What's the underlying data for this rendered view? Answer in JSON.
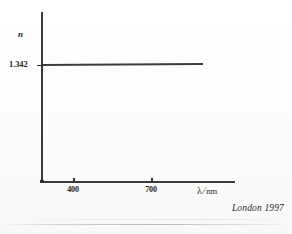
{
  "figure": {
    "attribution": "London 1997"
  },
  "chart_data": {
    "type": "line",
    "title": "",
    "subtitle": "",
    "xlabel_symbol": "λ",
    "xlabel_separator": "/",
    "xlabel_unit": "nm",
    "xlabel": "λ/nm",
    "ylabel": "n",
    "x_tick_labels": [
      "400",
      "700"
    ],
    "x_ticks": [
      400,
      700
    ],
    "y_tick_labels": [
      "1.342"
    ],
    "y_ticks": [
      1.342
    ],
    "xlim": [
      330,
      1080
    ],
    "ylim": [
      1.0,
      1.55
    ],
    "grid": false,
    "legend": null,
    "annotations": [],
    "series": [
      {
        "name": "refractive index",
        "x": [
          330,
          1010
        ],
        "values": [
          1.342,
          1.3426
        ],
        "style": "solid",
        "color": "#3c3c3e",
        "description": "near-horizontal line at n = 1.342, essentially constant across the wavelength range"
      }
    ]
  }
}
